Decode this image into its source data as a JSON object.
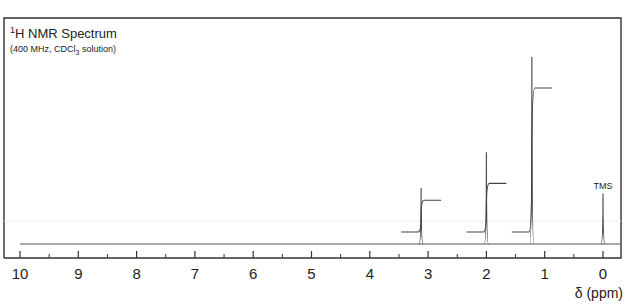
{
  "chart_data": {
    "type": "line",
    "title": "1H NMR Spectrum",
    "title_parts": {
      "sup": "1",
      "main": "H NMR Spectrum"
    },
    "subtitle": "(400 MHz, CDCl3 solution)",
    "subtitle_parts": {
      "pre": "(400 MHz, CDCl",
      "sub": "3",
      "post": " solution)"
    },
    "xlabel": "δ (ppm)",
    "ylabel": "",
    "xlim": [
      10,
      0
    ],
    "x_reversed": true,
    "major_ticks": [
      10,
      9,
      8,
      7,
      6,
      5,
      4,
      3,
      2,
      1,
      0
    ],
    "minor_ticks": [
      9.5,
      8.5,
      7.5,
      6.5,
      5.5,
      4.5,
      3.5,
      2.5,
      1.5,
      0.5
    ],
    "grid": false,
    "legend": null,
    "peaks": [
      {
        "ppm": 3.12,
        "relative_height": 0.3,
        "integral_step": 0.17,
        "label": ""
      },
      {
        "ppm": 2.0,
        "relative_height": 0.49,
        "integral_step": 0.26,
        "label": ""
      },
      {
        "ppm": 1.22,
        "relative_height": 1.0,
        "integral_step": 0.77,
        "label": ""
      },
      {
        "ppm": 0.0,
        "relative_height": 0.27,
        "integral_step": 0,
        "label": "TMS"
      }
    ],
    "annotations": [
      "TMS"
    ]
  },
  "labels": {
    "ticks": [
      "10",
      "9",
      "8",
      "7",
      "6",
      "5",
      "4",
      "3",
      "2",
      "1",
      "0"
    ],
    "xlabel": "δ (ppm)",
    "tms": "TMS"
  }
}
